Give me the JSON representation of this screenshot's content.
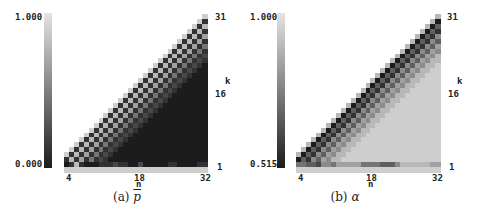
{
  "chart_data": [
    {
      "type": "heatmap",
      "title": "(a) p̄",
      "caption_prefix": "(a)",
      "caption_symbol": "p",
      "xlabel": "n",
      "ylabel": "k",
      "x_ticks": [
        "4",
        "18",
        "32"
      ],
      "y_ticks": [
        "31",
        "16",
        "1"
      ],
      "x_range": [
        4,
        32
      ],
      "y_range": [
        1,
        31
      ],
      "colorbar": {
        "max_label": "1.000",
        "min_label": "0.000",
        "min": 0.0,
        "max": 1.0,
        "colormap": "gray"
      },
      "level_scale": "each char 0-9 maps linearly from colorbar min to max; '.' = empty; rows listed top (k=31) to bottom, last row is bottom strip",
      "levels": [
        "............................8",
        "...........................81",
        "..........................817",
        ".........................8171",
        "........................81716",
        ".......................817161",
        "......................8171614",
        ".....................81716141",
        "....................817161412",
        "...................8171614121",
        "..................81716141210",
        ".................817161412100",
        "................8171614121000",
        "...............81716141210000",
        "..............817161412100000",
        ".............8171614121000000",
        "............81716141210000000",
        "...........817161412100000000",
        "..........8171614121000000000",
        ".........81716141210000000000",
        "........817161412100000000000",
        ".......8171614121000000000000",
        "......81716141210000000000000",
        ".....817161412100000000000000",
        "....8171614121000000000000000",
        "...81716141210000000000000000",
        "..817161412100000000000000000",
        ".8171614121000000000000000000",
        "81716141210000000000000000000",
        "17161412100000000000000000000",
        "01710001112110020000011000011",
        "88888888888888888888888888888"
      ]
    },
    {
      "type": "heatmap",
      "title": "(b) α",
      "caption_prefix": "(b)",
      "caption_symbol": "α",
      "xlabel": "n",
      "ylabel": "k",
      "x_ticks": [
        "4",
        "18",
        "32"
      ],
      "y_ticks": [
        "31",
        "16",
        "1"
      ],
      "x_range": [
        4,
        32
      ],
      "y_range": [
        1,
        31
      ],
      "colorbar": {
        "max_label": "1.000",
        "min_label": "0.515",
        "min": 0.515,
        "max": 1.0,
        "colormap": "gray"
      },
      "level_scale": "each char 0-9 maps linearly from colorbar min to max; '.' = empty; rows listed top (k=31) to bottom, last row is bottom strip",
      "levels": [
        "............................7",
        "...........................70",
        "..........................703",
        ".........................7031",
        "........................70315",
        ".......................703153",
        "......................7031536",
        ".....................70315365",
        "....................703153657",
        "...................7031536577",
        "..................70315365778",
        ".................703153657788",
        "................7031536577888",
        "...............70315365778888",
        "..............703153657788888",
        ".............7031536577888888",
        "............70315365778888888",
        "...........703153657788888888",
        "..........7031536577888888888",
        ".........70315365778888888888",
        "........703153657788888888888",
        ".......7031536577888888888888",
        "......70315365778888888888888",
        ".....703153657788888888888888",
        "....7031536577888888888888888",
        "...70315365778888888888888888",
        "..703153657788888888888888888",
        ".7031536577888888888888888888",
        "70315365778888888888888888888",
        "03153657788888888888888888888",
        "44332554666664444333577777766",
        "88888888888888888888888888888"
      ]
    }
  ]
}
